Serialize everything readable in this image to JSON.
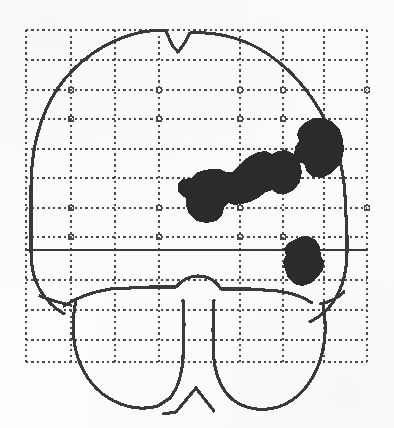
{
  "figure": {
    "kind": "glass-brain-projection",
    "view_label": "coronal",
    "canvas": {
      "width": 394,
      "height": 428
    },
    "background_color": "#fdfdfc",
    "ink_color": "#3a3a3a",
    "blob_color": "#2b2b2b"
  },
  "chart_data": {
    "type": "scatter",
    "title": "",
    "subtitle": "",
    "xlabel": "",
    "ylabel": "",
    "legend": [],
    "grid": true,
    "grid_style": "dotted",
    "grid_color": "#4a4a4a",
    "plot_box": {
      "x0": 26,
      "y0": 30,
      "x1": 367,
      "y1": 362
    },
    "xlim": [
      26,
      367
    ],
    "ylim": [
      30,
      362
    ],
    "x_gridlines": [
      26,
      71,
      115,
      159,
      200,
      240,
      283,
      324,
      367
    ],
    "y_gridlines": [
      30,
      60,
      90,
      119,
      149,
      178,
      208,
      237,
      250,
      280,
      310,
      340,
      362
    ],
    "reference_line": {
      "orientation": "horizontal",
      "y": 250,
      "style": "solid",
      "label": "ac-pc-plane"
    },
    "annotations": [
      {
        "name": "cerebrum-outline",
        "kind": "contour"
      },
      {
        "name": "cerebellum-left-lobe",
        "kind": "contour"
      },
      {
        "name": "cerebellum-right-lobe",
        "kind": "contour"
      },
      {
        "name": "brainstem-vermis",
        "kind": "contour"
      }
    ],
    "series": [
      {
        "name": "activation-clusters",
        "type": "blob",
        "color": "#2b2b2b",
        "values": [
          {
            "label": "cluster-1-lateral-diagonal",
            "cx": 243,
            "cy": 186,
            "w": 116,
            "h": 62
          },
          {
            "label": "cluster-2-superior-right",
            "cx": 320,
            "cy": 148,
            "w": 52,
            "h": 62
          },
          {
            "label": "cluster-3-inferior-right",
            "cx": 304,
            "cy": 261,
            "w": 44,
            "h": 50
          }
        ]
      }
    ]
  }
}
